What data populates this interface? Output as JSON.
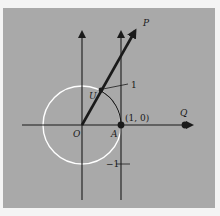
{
  "diagram": {
    "colors": {
      "page_bg": "#f4f4f4",
      "panel_bg": "#a9a9a9",
      "ink": "#1a1a1a",
      "circle": "#ffffff"
    },
    "points": {
      "origin": "O",
      "A": "A",
      "A_coords": "(1, 0)",
      "U": "U",
      "P": "P",
      "Q": "Q"
    },
    "tick_labels": {
      "plus_one": "1",
      "minus_one": "−1"
    }
  }
}
